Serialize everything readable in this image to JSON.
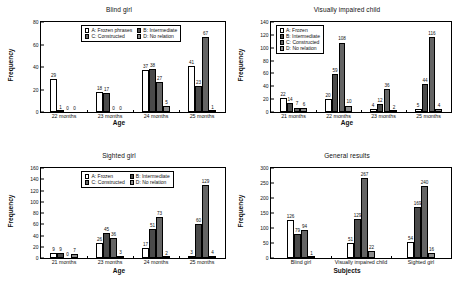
{
  "figure": {
    "background": "#ffffff",
    "series_colors": {
      "A": "#ffffff",
      "B": "#4a4a4a",
      "C": "#646464",
      "D": "#8c8c8c"
    }
  },
  "charts": [
    {
      "id": "blind-girl",
      "title": "Blind girl",
      "xlabel": "Age",
      "ylabel": "Frequency",
      "categories": [
        "22 months",
        "23 months",
        "24 months",
        "25 months"
      ],
      "ylim": [
        0,
        80
      ],
      "yticks": [
        0,
        20,
        40,
        60,
        80
      ],
      "legend_layout": "two-columns",
      "legend": [
        {
          "key": "A",
          "label": "A: Frozen phrases"
        },
        {
          "key": "B",
          "label": "B: Intermediate"
        },
        {
          "key": "C",
          "label": "C: Constructed"
        },
        {
          "key": "D",
          "label": "D: No relation"
        }
      ],
      "series": [
        {
          "name": "A: Frozen phrases",
          "key": "A",
          "values": [
            29,
            18,
            37,
            41
          ]
        },
        {
          "name": "B: Intermediate",
          "key": "B",
          "values": [
            1,
            17,
            38,
            23
          ]
        },
        {
          "name": "C: Constructed",
          "key": "C",
          "values": [
            0,
            0,
            27,
            67
          ]
        },
        {
          "name": "D: No relation",
          "key": "D",
          "values": [
            0,
            0,
            5,
            1
          ]
        }
      ]
    },
    {
      "id": "visually-impaired-child",
      "title": "Visually impaired child",
      "xlabel": "Age",
      "ylabel": "Frequency",
      "categories": [
        "21 months",
        "22 months",
        "23 months",
        "25 months"
      ],
      "ylim": [
        0,
        140
      ],
      "yticks": [
        0,
        20,
        40,
        60,
        80,
        100,
        120,
        140
      ],
      "legend_layout": "single-column",
      "legend": [
        {
          "key": "A",
          "label": "A: Frozen"
        },
        {
          "key": "B",
          "label": "B: Intermediate"
        },
        {
          "key": "C",
          "label": "C: Constructed"
        },
        {
          "key": "D",
          "label": "D: No relation"
        }
      ],
      "series": [
        {
          "name": "A: Frozen",
          "key": "A",
          "values": [
            22,
            20,
            4,
            5
          ]
        },
        {
          "name": "B: Intermediate",
          "key": "B",
          "values": [
            14,
            59,
            12,
            44
          ]
        },
        {
          "name": "C: Constructed",
          "key": "C",
          "values": [
            7,
            108,
            36,
            116
          ]
        },
        {
          "name": "D: No relation",
          "key": "D",
          "values": [
            6,
            10,
            2,
            4
          ]
        }
      ]
    },
    {
      "id": "sighted-girl",
      "title": "Sighted girl",
      "xlabel": "Age",
      "ylabel": "Frequency",
      "categories": [
        "21 months",
        "23 months",
        "24 months",
        "25 months"
      ],
      "ylim": [
        0,
        160
      ],
      "yticks": [
        0,
        20,
        40,
        60,
        80,
        100,
        120,
        140,
        160
      ],
      "legend_layout": "two-columns",
      "legend": [
        {
          "key": "A",
          "label": "A: Frozen"
        },
        {
          "key": "B",
          "label": "B: Intermediate"
        },
        {
          "key": "C",
          "label": "C: Constructed"
        },
        {
          "key": "D",
          "label": "D: No relation"
        }
      ],
      "series": [
        {
          "name": "A: Frozen",
          "key": "A",
          "values": [
            9,
            26,
            17,
            3
          ]
        },
        {
          "name": "B: Intermediate",
          "key": "B",
          "values": [
            9,
            45,
            51,
            60
          ]
        },
        {
          "name": "C: Constructed",
          "key": "C",
          "values": [
            0,
            36,
            73,
            129
          ]
        },
        {
          "name": "D: No relation",
          "key": "D",
          "values": [
            7,
            3,
            2,
            4
          ]
        }
      ]
    },
    {
      "id": "general-results",
      "title": "General results",
      "xlabel": "Subjects",
      "ylabel": "Frequency",
      "categories": [
        "Blind girl",
        "Visually impaired child",
        "Sighted girl"
      ],
      "ylim": [
        0,
        300
      ],
      "yticks": [
        0,
        50,
        100,
        150,
        200,
        250,
        300
      ],
      "legend_layout": "none",
      "legend": [],
      "series": [
        {
          "name": "A",
          "key": "A",
          "values": [
            126,
            51,
            54
          ]
        },
        {
          "name": "B",
          "key": "B",
          "values": [
            79,
            129,
            169
          ]
        },
        {
          "name": "C",
          "key": "C",
          "values": [
            94,
            267,
            240
          ]
        },
        {
          "name": "D",
          "key": "D",
          "values": [
            1,
            22,
            16
          ]
        }
      ]
    }
  ],
  "chart_data": [
    {
      "type": "bar",
      "title": "Blind girl",
      "xlabel": "Age",
      "ylabel": "Frequency",
      "categories": [
        "22 months",
        "23 months",
        "24 months",
        "25 months"
      ],
      "ylim": [
        0,
        80
      ],
      "grid": false,
      "legend_position": "upper-center",
      "series": [
        {
          "name": "A: Frozen phrases",
          "values": [
            29,
            18,
            37,
            41
          ]
        },
        {
          "name": "B: Intermediate",
          "values": [
            1,
            17,
            38,
            23
          ]
        },
        {
          "name": "C: Constructed",
          "values": [
            0,
            0,
            27,
            67
          ]
        },
        {
          "name": "D: No relation",
          "values": [
            0,
            0,
            5,
            1
          ]
        }
      ]
    },
    {
      "type": "bar",
      "title": "Visually impaired child",
      "xlabel": "Age",
      "ylabel": "Frequency",
      "categories": [
        "21 months",
        "22 months",
        "23 months",
        "25 months"
      ],
      "ylim": [
        0,
        140
      ],
      "grid": false,
      "legend_position": "upper-left",
      "series": [
        {
          "name": "A: Frozen",
          "values": [
            22,
            20,
            4,
            5
          ]
        },
        {
          "name": "B: Intermediate",
          "values": [
            14,
            59,
            12,
            44
          ]
        },
        {
          "name": "C: Constructed",
          "values": [
            7,
            108,
            36,
            116
          ]
        },
        {
          "name": "D: No relation",
          "values": [
            6,
            10,
            2,
            4
          ]
        }
      ]
    },
    {
      "type": "bar",
      "title": "Sighted girl",
      "xlabel": "Age",
      "ylabel": "Frequency",
      "categories": [
        "21 months",
        "23 months",
        "24 months",
        "25 months"
      ],
      "ylim": [
        0,
        160
      ],
      "grid": false,
      "legend_position": "upper-center",
      "series": [
        {
          "name": "A: Frozen",
          "values": [
            9,
            26,
            17,
            3
          ]
        },
        {
          "name": "B: Intermediate",
          "values": [
            9,
            45,
            51,
            60
          ]
        },
        {
          "name": "C: Constructed",
          "values": [
            0,
            36,
            73,
            129
          ]
        },
        {
          "name": "D: No relation",
          "values": [
            7,
            3,
            2,
            4
          ]
        }
      ]
    },
    {
      "type": "bar",
      "title": "General results",
      "xlabel": "Subjects",
      "ylabel": "Frequency",
      "categories": [
        "Blind girl",
        "Visually impaired child",
        "Sighted girl"
      ],
      "ylim": [
        0,
        300
      ],
      "grid": false,
      "legend_position": "none",
      "series": [
        {
          "name": "A",
          "values": [
            126,
            51,
            54
          ]
        },
        {
          "name": "B",
          "values": [
            79,
            129,
            169
          ]
        },
        {
          "name": "C",
          "values": [
            94,
            267,
            240
          ]
        },
        {
          "name": "D",
          "values": [
            1,
            22,
            16
          ]
        }
      ]
    }
  ]
}
